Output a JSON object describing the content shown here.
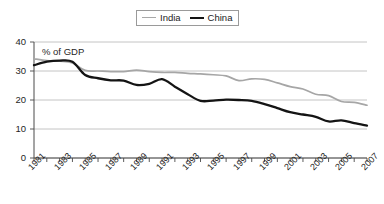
{
  "legend": {
    "position": "top-center",
    "entries": [
      {
        "label": "India",
        "color": "#a6a6a6",
        "icon": "line-swatch"
      },
      {
        "label": "China",
        "color": "#141414",
        "icon": "line-swatch"
      }
    ]
  },
  "annotation": {
    "text": "% of GDP"
  },
  "chart_data": {
    "type": "line",
    "title": "",
    "subtitle": "",
    "xlabel": "",
    "ylabel": "",
    "annotations": [
      "% of GDP"
    ],
    "grid": true,
    "legend_position": "top-center",
    "xlim": [
      1981,
      2007
    ],
    "ylim": [
      0,
      40
    ],
    "yticks": [
      0,
      10,
      20,
      30,
      40
    ],
    "ytick_labels": [
      "0",
      "10",
      "20",
      "30",
      "40"
    ],
    "x": [
      1981,
      1982,
      1983,
      1984,
      1985,
      1986,
      1987,
      1988,
      1989,
      1990,
      1991,
      1992,
      1993,
      1994,
      1995,
      1996,
      1997,
      1998,
      1999,
      2000,
      2001,
      2002,
      2003,
      2004,
      2005,
      2006,
      2007
    ],
    "xtick_labels": [
      "1981",
      "1983",
      "1985",
      "1987",
      "1989",
      "1991",
      "1993",
      "1995",
      "1997",
      "1999",
      "2001",
      "2003",
      "2005",
      "2007"
    ],
    "xtick_years": [
      1981,
      1983,
      1985,
      1987,
      1989,
      1991,
      1993,
      1995,
      1997,
      1999,
      2001,
      2003,
      2005,
      2007
    ],
    "series": [
      {
        "name": "India",
        "color": "#a6a6a6",
        "values": [
          34.2,
          33.6,
          33.4,
          32.8,
          30.2,
          30.0,
          29.8,
          29.8,
          30.3,
          29.8,
          29.5,
          29.5,
          29.2,
          29.0,
          28.7,
          28.3,
          26.7,
          27.3,
          27.1,
          25.9,
          24.6,
          23.8,
          22.0,
          21.5,
          19.5,
          19.2,
          18.2
        ]
      },
      {
        "name": "China",
        "color": "#141414",
        "values": [
          32.0,
          33.2,
          33.6,
          33.2,
          28.6,
          27.5,
          26.8,
          26.7,
          25.2,
          25.6,
          27.2,
          24.6,
          22.0,
          19.7,
          19.8,
          20.1,
          20.0,
          19.7,
          18.6,
          17.2,
          15.8,
          15.0,
          14.2,
          12.6,
          13.0,
          12.0,
          11.2
        ]
      }
    ]
  }
}
